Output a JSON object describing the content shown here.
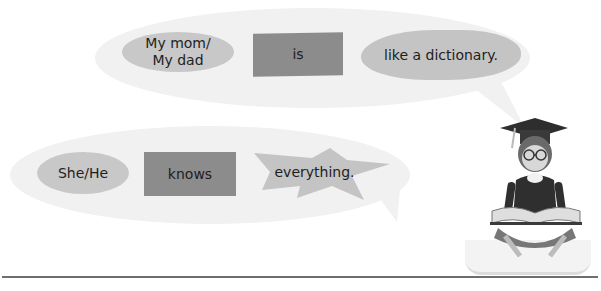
{
  "sentences": [
    {
      "subject": {
        "line1": "My mom/",
        "line2": "My dad"
      },
      "verb": "is",
      "complement": "like a dictionary."
    },
    {
      "subject": {
        "line1": "She/He"
      },
      "verb": "knows",
      "complement": "everything."
    }
  ],
  "illustration": {
    "label": "graduate-reading-book"
  },
  "colors": {
    "bubble": "#f1f1f1",
    "subject_shape": "#c8c8c8",
    "verb_shape": "#8c8c8c",
    "complement_shape": "#c4c4c4",
    "rule": "#6e6e6e"
  }
}
